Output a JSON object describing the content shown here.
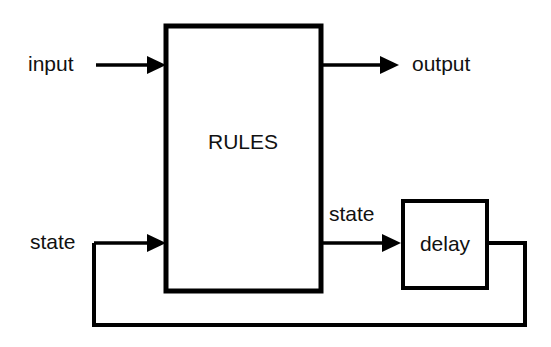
{
  "diagram": {
    "canvas": {
      "width": 551,
      "height": 347,
      "background": "#ffffff"
    },
    "stroke_color": "#000000",
    "text_color": "#111111",
    "blocks": [
      {
        "id": "rules",
        "label": "RULES",
        "x": 166,
        "y": 26,
        "width": 155,
        "height": 265,
        "label_x": 243,
        "label_y": 143
      },
      {
        "id": "delay",
        "label": "delay",
        "x": 403,
        "y": 201,
        "width": 84,
        "height": 87,
        "label_x": 445,
        "label_y": 245
      }
    ],
    "labels": [
      {
        "id": "input",
        "text": "input",
        "x": 28,
        "y": 65,
        "anchor": "start"
      },
      {
        "id": "output",
        "text": "output",
        "x": 412,
        "y": 65,
        "anchor": "start"
      },
      {
        "id": "state-in",
        "text": "state",
        "x": 30,
        "y": 243,
        "anchor": "start"
      },
      {
        "id": "state-out",
        "text": "state",
        "x": 329,
        "y": 215,
        "anchor": "start"
      }
    ],
    "connections": [
      {
        "id": "input-arrow",
        "from": "input label",
        "to": "rules block",
        "path": "M 96 65 L 158 65",
        "arrow_at": [
          166,
          65
        ],
        "direction": "right"
      },
      {
        "id": "output-arrow",
        "from": "rules block",
        "to": "output label",
        "path": "M 321 65 L 388 65",
        "arrow_at": [
          398,
          65
        ],
        "direction": "right"
      },
      {
        "id": "state-feedback-arrow",
        "from": "feedback loop",
        "to": "rules block",
        "path": "M 94 243 L 158 243",
        "arrow_at": [
          166,
          243
        ],
        "direction": "right"
      },
      {
        "id": "state-to-delay-arrow",
        "from": "rules block",
        "to": "delay block",
        "path": "M 321 243 L 388 243",
        "arrow_at": [
          398,
          243
        ],
        "direction": "right"
      },
      {
        "id": "feedback-loop-path",
        "from": "delay block",
        "to": "state feedback arrow",
        "path": "M 487 243 L 525 243 L 525 325 L 94 325 L 94 243",
        "arrow_at": null,
        "direction": "loop"
      }
    ]
  }
}
